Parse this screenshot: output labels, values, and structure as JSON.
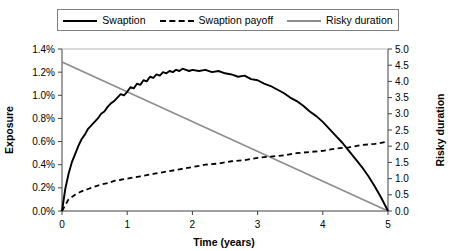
{
  "legend": {
    "entries": [
      {
        "label": "Swaption",
        "style": "solid",
        "color": "#000000"
      },
      {
        "label": "Swaption payoff",
        "style": "dashed",
        "color": "#000000"
      },
      {
        "label": "Risky duration",
        "style": "solid",
        "color": "#8c8c8c"
      }
    ]
  },
  "chart_data": {
    "type": "line",
    "title": "",
    "xlabel": "Time (years)",
    "ylabel": "Exposure",
    "y2label": "Risky duration",
    "xlim": [
      0,
      5
    ],
    "ylim": [
      0,
      0.014
    ],
    "y2lim": [
      0,
      5
    ],
    "grid": false,
    "legend_position": "top",
    "xticks": [
      "0",
      "1",
      "2",
      "3",
      "4",
      "5"
    ],
    "xtick_values": [
      0,
      1,
      2,
      3,
      4,
      5
    ],
    "yticks": [
      "0.0%",
      "0.2%",
      "0.4%",
      "0.6%",
      "0.8%",
      "1.0%",
      "1.2%",
      "1.4%"
    ],
    "ytick_values": [
      0.0,
      0.002,
      0.004,
      0.006,
      0.008,
      0.01,
      0.012,
      0.014
    ],
    "y2ticks": [
      "0.0",
      "0.5",
      "1.0",
      "1.5",
      "2.0",
      "2.5",
      "3.0",
      "3.5",
      "4.0",
      "4.5",
      "5.0"
    ],
    "y2tick_values": [
      0.0,
      0.5,
      1.0,
      1.5,
      2.0,
      2.5,
      3.0,
      3.5,
      4.0,
      4.5,
      5.0
    ],
    "series": [
      {
        "name": "Swaption",
        "axis": "left",
        "style": "solid",
        "color": "#000000",
        "x": [
          0.0,
          0.05,
          0.1,
          0.15,
          0.2,
          0.25,
          0.3,
          0.35,
          0.4,
          0.45,
          0.5,
          0.55,
          0.6,
          0.65,
          0.7,
          0.75,
          0.8,
          0.85,
          0.9,
          0.95,
          1.0,
          1.05,
          1.1,
          1.15,
          1.2,
          1.25,
          1.3,
          1.35,
          1.4,
          1.45,
          1.5,
          1.55,
          1.6,
          1.65,
          1.7,
          1.75,
          1.8,
          1.85,
          1.9,
          1.95,
          2.0,
          2.1,
          2.2,
          2.3,
          2.4,
          2.5,
          2.6,
          2.7,
          2.8,
          2.9,
          3.0,
          3.1,
          3.2,
          3.3,
          3.4,
          3.5,
          3.6,
          3.7,
          3.8,
          3.9,
          4.0,
          4.1,
          4.2,
          4.3,
          4.4,
          4.5,
          4.6,
          4.7,
          4.8,
          4.9,
          5.0
        ],
        "y": [
          0.0,
          0.0019,
          0.0032,
          0.0042,
          0.0049,
          0.0056,
          0.0062,
          0.0066,
          0.0071,
          0.0074,
          0.0077,
          0.008,
          0.0084,
          0.0086,
          0.009,
          0.0093,
          0.0095,
          0.0098,
          0.0101,
          0.01,
          0.0103,
          0.0107,
          0.0106,
          0.011,
          0.0109,
          0.0113,
          0.0112,
          0.0116,
          0.0115,
          0.0118,
          0.0117,
          0.012,
          0.0119,
          0.0121,
          0.012,
          0.0122,
          0.0121,
          0.0123,
          0.0122,
          0.0121,
          0.0122,
          0.0121,
          0.0122,
          0.012,
          0.0121,
          0.0119,
          0.0118,
          0.0116,
          0.0117,
          0.0114,
          0.0113,
          0.011,
          0.0108,
          0.0105,
          0.0102,
          0.0098,
          0.0095,
          0.0091,
          0.0086,
          0.0082,
          0.0077,
          0.0071,
          0.0065,
          0.0059,
          0.0052,
          0.0045,
          0.0038,
          0.003,
          0.0021,
          0.0011,
          0.0
        ]
      },
      {
        "name": "Swaption payoff",
        "axis": "left",
        "style": "dashed",
        "color": "#000000",
        "x": [
          0.0,
          0.1,
          0.2,
          0.3,
          0.4,
          0.5,
          0.6,
          0.7,
          0.8,
          0.9,
          1.0,
          1.2,
          1.4,
          1.6,
          1.8,
          2.0,
          2.2,
          2.4,
          2.6,
          2.8,
          3.0,
          3.2,
          3.4,
          3.6,
          3.8,
          4.0,
          4.2,
          4.4,
          4.6,
          4.8,
          5.0
        ],
        "y": [
          0.0,
          0.001,
          0.0014,
          0.0017,
          0.0019,
          0.0021,
          0.0023,
          0.0024,
          0.0026,
          0.0027,
          0.0028,
          0.003,
          0.0032,
          0.0034,
          0.0036,
          0.0038,
          0.004,
          0.0041,
          0.0043,
          0.0044,
          0.0046,
          0.0047,
          0.0048,
          0.005,
          0.0051,
          0.0052,
          0.0054,
          0.0055,
          0.0057,
          0.0058,
          0.006
        ]
      },
      {
        "name": "Risky duration",
        "axis": "right",
        "style": "solid",
        "color": "#8c8c8c",
        "x": [
          0,
          5
        ],
        "y": [
          4.6,
          0.0
        ]
      }
    ]
  }
}
